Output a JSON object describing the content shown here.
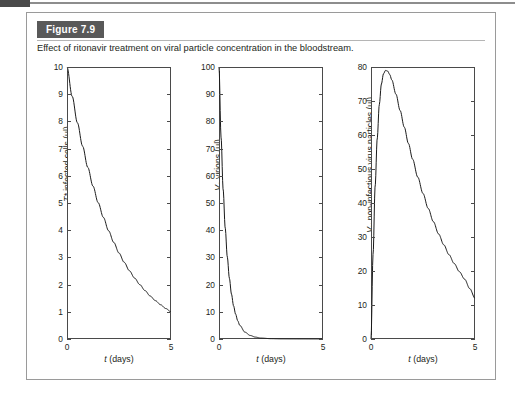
{
  "figure": {
    "badge_label": "Figure 7.9",
    "caption": "Effect of ritonavir treatment on viral particle concentration in the bloodstream."
  },
  "chart_data": [
    {
      "type": "line",
      "panel_index": 1,
      "title": "",
      "xlabel": "t (days)",
      "ylabel": "T* infected cells (µl)",
      "ylabel_symbol": "T*",
      "ylabel_rest": " infected cells (µl)",
      "xlim": [
        0,
        5
      ],
      "ylim": [
        0,
        10
      ],
      "xticks": [
        0,
        5
      ],
      "xticklabels": [
        "0",
        "5"
      ],
      "yticks": [
        0,
        1,
        2,
        3,
        4,
        5,
        6,
        7,
        8,
        9,
        10
      ],
      "yticklabels": [
        "0",
        "1",
        "2",
        "3",
        "4",
        "5",
        "6",
        "7",
        "8",
        "9",
        "10"
      ],
      "grid": false,
      "legend": false,
      "curve_color": "#1a1a1a",
      "model": "exponential_decay",
      "x": [
        0,
        0.25,
        0.5,
        0.75,
        1,
        1.25,
        1.5,
        1.75,
        2,
        2.25,
        2.5,
        2.75,
        3,
        3.25,
        3.5,
        3.75,
        4,
        4.25,
        4.5,
        4.75,
        5
      ],
      "y": [
        10.0,
        8.92,
        7.95,
        7.09,
        6.31,
        5.62,
        5.01,
        4.47,
        3.98,
        3.55,
        3.16,
        2.82,
        2.51,
        2.24,
        2.0,
        1.78,
        1.58,
        1.41,
        1.26,
        1.12,
        1.0
      ]
    },
    {
      "type": "line",
      "panel_index": 2,
      "title": "",
      "xlabel": "t (days)",
      "ylabel": "V1 virions (µl)",
      "ylabel_symbol": "V",
      "ylabel_sub": "1",
      "ylabel_rest": " virions (µl)",
      "xlim": [
        0,
        5
      ],
      "ylim": [
        0,
        100
      ],
      "xticks": [
        0,
        5
      ],
      "xticklabels": [
        "0",
        "5"
      ],
      "yticks": [
        0,
        10,
        20,
        30,
        40,
        50,
        60,
        70,
        80,
        90,
        100
      ],
      "yticklabels": [
        "0",
        "10",
        "20",
        "30",
        "40",
        "50",
        "60",
        "70",
        "80",
        "90",
        "100"
      ],
      "grid": false,
      "legend": false,
      "curve_color": "#1a1a1a",
      "model": "fast_exponential_decay",
      "x": [
        0,
        0.1,
        0.2,
        0.3,
        0.4,
        0.5,
        0.6,
        0.7,
        0.8,
        0.9,
        1.0,
        1.25,
        1.5,
        1.75,
        2.0,
        2.5,
        3.0,
        3.5,
        4.0,
        4.5,
        5.0
      ],
      "y": [
        100.0,
        74.1,
        54.9,
        40.7,
        30.1,
        22.3,
        16.5,
        12.2,
        9.1,
        6.7,
        5.0,
        2.5,
        1.3,
        0.7,
        0.35,
        0.12,
        0.05,
        0.03,
        0.02,
        0.01,
        0.0
      ]
    },
    {
      "type": "line",
      "panel_index": 3,
      "title": "",
      "xlabel": "t (days)",
      "ylabel": "VX non-infectious virus particles (µl)",
      "ylabel_symbol": "V",
      "ylabel_sub": "X",
      "ylabel_rest": " non-infectious virus particles (µl)",
      "xlim": [
        0,
        5
      ],
      "ylim": [
        0,
        80
      ],
      "xticks": [
        0,
        5
      ],
      "xticklabels": [
        "0",
        "5"
      ],
      "yticks": [
        0,
        10,
        20,
        30,
        40,
        50,
        60,
        70,
        80
      ],
      "yticklabels": [
        "0",
        "10",
        "20",
        "30",
        "40",
        "50",
        "60",
        "70",
        "80"
      ],
      "grid": false,
      "legend": false,
      "curve_color": "#1a1a1a",
      "model": "rise_then_decay",
      "peak_value": 79,
      "peak_x": 0.72,
      "x": [
        0,
        0.1,
        0.2,
        0.3,
        0.4,
        0.5,
        0.6,
        0.7,
        0.8,
        0.9,
        1.0,
        1.2,
        1.4,
        1.6,
        1.8,
        2.0,
        2.25,
        2.5,
        2.75,
        3.0,
        3.25,
        3.5,
        3.75,
        4.0,
        4.25,
        4.5,
        4.75,
        5.0
      ],
      "y": [
        0,
        25,
        45,
        59,
        69,
        75,
        78,
        79,
        78.8,
        77.8,
        76.2,
        72.0,
        67.2,
        62.3,
        57.5,
        52.9,
        47.6,
        42.8,
        38.4,
        34.5,
        30.9,
        27.7,
        24.8,
        22.2,
        19.8,
        17.6,
        14.8,
        12.0
      ]
    }
  ]
}
